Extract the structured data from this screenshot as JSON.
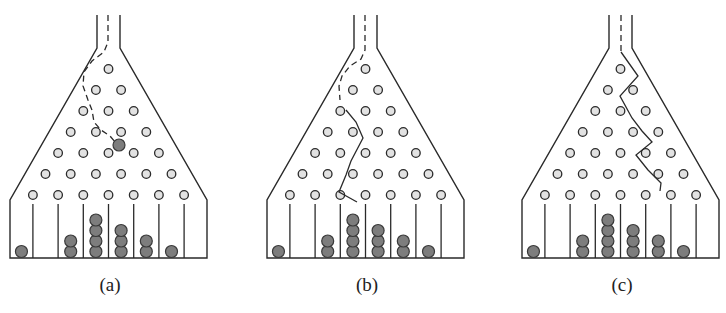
{
  "figure": {
    "panels": [
      {
        "label": "(a)",
        "offset_x": 0,
        "path_style": "dashed",
        "path_points": [
          [
            108,
            15
          ],
          [
            108,
            42
          ],
          [
            104,
            52
          ],
          [
            92,
            61
          ],
          [
            84,
            72
          ],
          [
            83,
            86
          ],
          [
            88,
            100
          ],
          [
            92,
            110
          ],
          [
            94,
            122
          ],
          [
            101,
            130
          ],
          [
            110,
            136
          ],
          [
            116,
            143
          ]
        ],
        "falling_ball": {
          "x": 119,
          "y": 145
        },
        "bins": [
          1,
          0,
          2,
          4,
          3,
          2,
          1,
          0
        ]
      },
      {
        "label": "(b)",
        "offset_x": 257,
        "path_style": "mixed",
        "dashed_points": [
          [
            365,
            15
          ],
          [
            365,
            50
          ],
          [
            361,
            59
          ],
          [
            350,
            66
          ],
          [
            342,
            76
          ],
          [
            339,
            86
          ],
          [
            340,
            100
          ]
        ],
        "solid_points": [
          [
            346,
            110
          ],
          [
            356,
            122
          ],
          [
            363,
            138
          ],
          [
            351,
            161
          ],
          [
            346,
            175
          ],
          [
            339,
            192
          ],
          [
            357,
            202
          ]
        ],
        "falling_ball": null,
        "bins": [
          1,
          0,
          2,
          4,
          3,
          2,
          1,
          0
        ]
      },
      {
        "label": "(c)",
        "offset_x": 512,
        "path_style": "mixed",
        "dashed_points": [
          [
            621,
            15
          ],
          [
            621,
            52
          ]
        ],
        "solid_points": [
          [
            621,
            52
          ],
          [
            638,
            76
          ],
          [
            620,
            96
          ],
          [
            632,
            118
          ],
          [
            642,
            131
          ],
          [
            652,
            142
          ],
          [
            636,
            155
          ],
          [
            648,
            170
          ],
          [
            661,
            183
          ],
          [
            660,
            191
          ]
        ],
        "falling_ball": null,
        "bins": [
          1,
          0,
          2,
          4,
          3,
          2,
          1,
          0
        ]
      }
    ],
    "geometry": {
      "tube_left_x": 97,
      "tube_right_x": 120,
      "tube_top_y": 15,
      "neck_y": 48,
      "wall_left_x": 10,
      "wall_right_x": 207,
      "shoulder_y": 200,
      "floor_y": 258,
      "peg_rows": 7,
      "peg_top_y": 69,
      "peg_row_spacing": 21,
      "peg_spacing_x": 25.2,
      "peg_center_x": 108.5,
      "peg_radius": 4.3,
      "ball_radius": 6,
      "divider_top_y": 204
    },
    "colors": {
      "line": "#2a2a2a",
      "peg_fill": "#e2e2e2",
      "ball_fill": "#7d7d7d",
      "ball_stroke": "#3a3a3a",
      "background": "#ffffff"
    }
  }
}
